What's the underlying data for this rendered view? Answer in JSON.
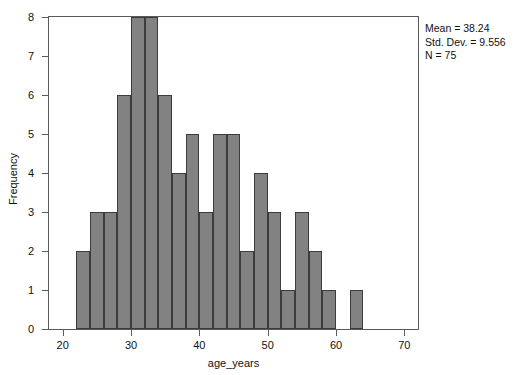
{
  "chart_data": {
    "type": "bar",
    "title": "",
    "xlabel": "age_years",
    "ylabel": "Frequency",
    "xlim": [
      18,
      72
    ],
    "ylim": [
      0,
      8
    ],
    "grid": false,
    "bin_width": 2,
    "bin_starts": [
      22,
      24,
      26,
      28,
      30,
      32,
      34,
      36,
      38,
      40,
      42,
      44,
      46,
      48,
      50,
      52,
      54,
      56,
      58,
      60,
      62
    ],
    "categories": [
      "22-24",
      "24-26",
      "26-28",
      "28-30",
      "30-32",
      "32-34",
      "34-36",
      "36-38",
      "38-40",
      "40-42",
      "42-44",
      "44-46",
      "46-48",
      "48-50",
      "50-52",
      "52-54",
      "54-56",
      "56-58",
      "58-60",
      "60-62",
      "62-64"
    ],
    "values": [
      2,
      3,
      3,
      6,
      8,
      8,
      6,
      4,
      5,
      3,
      5,
      5,
      2,
      4,
      3,
      1,
      3,
      2,
      1,
      0,
      1
    ],
    "xticks": [
      20,
      30,
      40,
      50,
      60,
      70
    ],
    "xtick_labels": [
      "20",
      "30",
      "40",
      "50",
      "60",
      "70"
    ],
    "yticks": [
      0,
      1,
      2,
      3,
      4,
      5,
      6,
      7,
      8
    ],
    "ytick_labels": [
      "0",
      "1",
      "2",
      "3",
      "4",
      "5",
      "6",
      "7",
      "8"
    ],
    "bar_color": "#828282",
    "bar_edge_color": "#3c3c3c",
    "frame_color": "#5a5a5a",
    "legend_position": "none",
    "annotations": {
      "mean_label": "Mean = 38.24",
      "std_dev_label": "Std. Dev. = 9.556",
      "n_label": "N = 75"
    }
  }
}
